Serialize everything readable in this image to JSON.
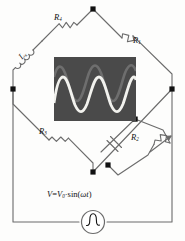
{
  "diagram": {
    "type": "schematic",
    "background": "#fdfdfc",
    "wire_color": "#6b6b6b",
    "node_color": "#111111"
  },
  "components": {
    "r4": {
      "label": "R",
      "subscript": "4",
      "name": "resistor-r4",
      "kind": "resistor",
      "position": "top-left-branch"
    },
    "r1": {
      "label": "R",
      "subscript": "1",
      "name": "resistor-r1",
      "kind": "resistor",
      "position": "top-right-branch"
    },
    "lx": {
      "label": "L",
      "subscript": "x",
      "name": "inductor-lx",
      "kind": "inductor",
      "position": "left-branch"
    },
    "r3": {
      "label": "R",
      "subscript": "3",
      "name": "resistor-r3",
      "kind": "resistor",
      "position": "bottom-left-branch"
    },
    "r2": {
      "label": "R",
      "subscript": "2",
      "name": "variable-resistor-r2",
      "kind": "variable-resistor",
      "position": "bottom-right-branch"
    },
    "capacitor": {
      "label": "",
      "name": "capacitor",
      "kind": "capacitor",
      "position": "bottom-right-branch-parallel"
    },
    "source": {
      "name": "ac-voltage-source",
      "kind": "ac-source",
      "equation": "V=V0·sin(ωt)"
    }
  },
  "source_label": {
    "v": "V",
    "eq": "=",
    "v0": "V",
    "v0_sub": "0",
    "middot": "·",
    "fn": "sin(",
    "omega": "ω",
    "t": "t",
    "close": ")"
  },
  "scope": {
    "name": "oscilloscope-screen",
    "screen_color": "#4a4a4a",
    "trace_primary_color": "#f2f2ee",
    "trace_secondary_color": "#6e6e6e",
    "traces": [
      {
        "name": "trace-bright",
        "color": "#f2f2ee",
        "cycles": 3,
        "amplitude": 20,
        "phase_deg": 0
      },
      {
        "name": "trace-dim",
        "color": "#6e6e6e",
        "cycles": 3,
        "amplitude": 18,
        "phase_deg": 150
      }
    ]
  },
  "nodes": [
    {
      "name": "node-top",
      "x": 93,
      "y": 9
    },
    {
      "name": "node-left",
      "x": 13,
      "y": 89
    },
    {
      "name": "node-right",
      "x": 172,
      "y": 89
    },
    {
      "name": "node-bottom",
      "x": 93,
      "y": 172
    },
    {
      "name": "node-branch-upper",
      "x": 135,
      "y": 119
    },
    {
      "name": "node-branch-lower",
      "x": 108,
      "y": 165
    }
  ]
}
